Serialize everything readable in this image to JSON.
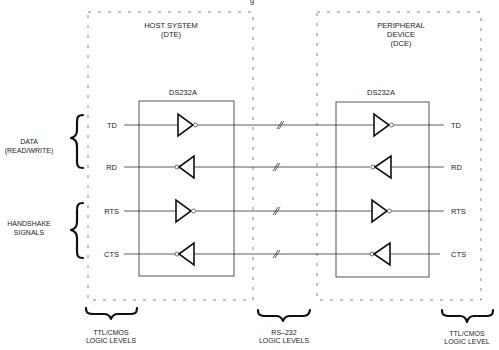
{
  "top_cut_text": "g",
  "regions": {
    "host": {
      "title_line1": "HOST SYSTEM",
      "title_line2": "(DTE)"
    },
    "peripheral": {
      "title_line1": "PERIPHERAL",
      "title_line2": "DEVICE",
      "title_line3": "(DCE)"
    }
  },
  "chips": {
    "left": {
      "label": "DS232A"
    },
    "right": {
      "label": "DS232A"
    }
  },
  "signals": [
    {
      "name": "TD",
      "direction": "out",
      "left_label": "TD",
      "right_label": "TD"
    },
    {
      "name": "RD",
      "direction": "in",
      "left_label": "RD",
      "right_label": "RD"
    },
    {
      "name": "RTS",
      "direction": "out",
      "left_label": "RTS",
      "right_label": "RTS"
    },
    {
      "name": "CTS",
      "direction": "in",
      "left_label": "CTS",
      "right_label": "CTS"
    }
  ],
  "groups": {
    "data": {
      "line1": "DATA",
      "line2": "(READ/WRITE)"
    },
    "handshake": {
      "line1": "HANDSHAKE",
      "line2": "SIGNALS"
    }
  },
  "levels": {
    "left": {
      "line1": "TTL/CMOS",
      "line2": "LOGIC LEVELS"
    },
    "middle": {
      "line1": "RS–232",
      "line2": "LOGIC LEVELS"
    },
    "right": {
      "line1": "TTL/CMOS",
      "line2": "LOGIC LEVEL"
    }
  }
}
